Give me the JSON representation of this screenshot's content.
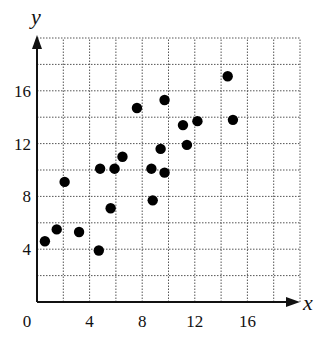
{
  "chart_data": {
    "type": "scatter",
    "title": "",
    "xlabel": "x",
    "ylabel": "y",
    "xlim": [
      0,
      20
    ],
    "ylim": [
      0,
      20
    ],
    "grid": true,
    "grid_style": "dotted",
    "grid_step": 2,
    "legend": null,
    "x_ticks": [
      {
        "value": 0,
        "label": "0"
      },
      {
        "value": 4,
        "label": "4"
      },
      {
        "value": 8,
        "label": "8"
      },
      {
        "value": 12,
        "label": "12"
      },
      {
        "value": 16,
        "label": "16"
      }
    ],
    "y_ticks": [
      {
        "value": 4,
        "label": "4"
      },
      {
        "value": 8,
        "label": "8"
      },
      {
        "value": 12,
        "label": "12"
      },
      {
        "value": 16,
        "label": "16"
      }
    ],
    "series": [
      {
        "name": "points",
        "color": "#000000",
        "points": [
          {
            "x": 0.6,
            "y": 4.6
          },
          {
            "x": 1.5,
            "y": 5.5
          },
          {
            "x": 2.1,
            "y": 9.1
          },
          {
            "x": 3.2,
            "y": 5.3
          },
          {
            "x": 4.7,
            "y": 3.9
          },
          {
            "x": 4.8,
            "y": 10.1
          },
          {
            "x": 5.6,
            "y": 7.1
          },
          {
            "x": 5.9,
            "y": 10.1
          },
          {
            "x": 6.5,
            "y": 11.0
          },
          {
            "x": 7.6,
            "y": 14.7
          },
          {
            "x": 8.7,
            "y": 10.1
          },
          {
            "x": 8.8,
            "y": 7.7
          },
          {
            "x": 9.4,
            "y": 11.6
          },
          {
            "x": 9.7,
            "y": 15.3
          },
          {
            "x": 9.7,
            "y": 9.8
          },
          {
            "x": 11.1,
            "y": 13.4
          },
          {
            "x": 11.4,
            "y": 11.9
          },
          {
            "x": 12.2,
            "y": 13.7
          },
          {
            "x": 14.5,
            "y": 17.1
          },
          {
            "x": 14.9,
            "y": 13.8
          }
        ]
      }
    ]
  },
  "colors": {
    "axis": "#111111",
    "grid": "#555555",
    "point": "#000000"
  }
}
